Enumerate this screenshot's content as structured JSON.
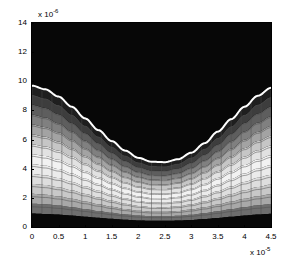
{
  "figure": {
    "title": "",
    "background_color": "#ffffff",
    "axis_color": "#000000",
    "plot_box": {
      "left": 31,
      "top": 22,
      "width": 241,
      "height": 206
    }
  },
  "xaxis": {
    "label": "",
    "exponent_label": "x 10",
    "exponent_value": "-5",
    "tick_labels": [
      "0",
      "0.5",
      "1",
      "1.5",
      "2",
      "2.5",
      "3",
      "3.5",
      "4",
      "4.5"
    ],
    "tick_values": [
      0,
      0.5,
      1,
      1.5,
      2,
      2.5,
      3,
      3.5,
      4,
      4.5
    ],
    "range": [
      0,
      4.5
    ]
  },
  "yaxis": {
    "label": "",
    "exponent_label": "x 10",
    "exponent_value": "-6",
    "tick_labels": [
      "0",
      "2",
      "4",
      "6",
      "8",
      "10",
      "12",
      "14"
    ],
    "tick_values": [
      0,
      2,
      4,
      6,
      8,
      10,
      12,
      14
    ],
    "range": [
      0,
      14
    ]
  },
  "chart_data": {
    "type": "heatmap",
    "title": "",
    "xlabel": "",
    "ylabel": "",
    "xlim": [
      0,
      4.5
    ],
    "ylim": [
      0,
      14
    ],
    "x_unit_exponent": -5,
    "y_unit_exponent": -6,
    "grid": true,
    "mesh_overlay": true,
    "colormap": "gray",
    "legend": "none",
    "white_curve": {
      "name": "interface",
      "color": "#ffffff",
      "line_width": 2,
      "x": [
        0.0,
        0.25,
        0.5,
        0.75,
        1.0,
        1.25,
        1.5,
        1.75,
        2.0,
        2.25,
        2.5,
        2.75,
        3.0,
        3.25,
        3.5,
        3.75,
        4.0,
        4.25,
        4.5
      ],
      "y": [
        9.7,
        9.45,
        8.95,
        8.25,
        7.45,
        6.65,
        5.9,
        5.25,
        4.75,
        4.48,
        4.45,
        4.65,
        5.1,
        5.75,
        6.55,
        7.4,
        8.25,
        9.0,
        9.55
      ]
    },
    "bands": [
      {
        "index": 0,
        "label": "band-0",
        "color": "#0a0a0a",
        "frac_lo": 0.0,
        "frac_hi": 0.095
      },
      {
        "index": 1,
        "label": "band-1",
        "color": "#6e6e6e",
        "frac_lo": 0.095,
        "frac_hi": 0.165
      },
      {
        "index": 2,
        "label": "band-2",
        "color": "#a8a8a8",
        "frac_lo": 0.165,
        "frac_hi": 0.235
      },
      {
        "index": 3,
        "label": "band-3",
        "color": "#c8c8c8",
        "frac_lo": 0.235,
        "frac_hi": 0.305
      },
      {
        "index": 4,
        "label": "band-4",
        "color": "#dedede",
        "frac_lo": 0.305,
        "frac_hi": 0.375
      },
      {
        "index": 5,
        "label": "band-5",
        "color": "#ebebeb",
        "frac_lo": 0.375,
        "frac_hi": 0.445
      },
      {
        "index": 6,
        "label": "band-6",
        "color": "#f2f2f2",
        "frac_lo": 0.445,
        "frac_hi": 0.515
      },
      {
        "index": 7,
        "label": "band-7",
        "color": "#e2e2e2",
        "frac_lo": 0.515,
        "frac_hi": 0.585
      },
      {
        "index": 8,
        "label": "band-8",
        "color": "#c6c6c6",
        "frac_lo": 0.585,
        "frac_hi": 0.655
      },
      {
        "index": 9,
        "label": "band-9",
        "color": "#a3a3a3",
        "frac_lo": 0.655,
        "frac_hi": 0.725
      },
      {
        "index": 10,
        "label": "band-10",
        "color": "#808080",
        "frac_lo": 0.725,
        "frac_hi": 0.795
      },
      {
        "index": 11,
        "label": "band-11",
        "color": "#5e5e5e",
        "frac_lo": 0.795,
        "frac_hi": 0.865
      },
      {
        "index": 12,
        "label": "band-12",
        "color": "#3d3d3d",
        "frac_lo": 0.865,
        "frac_hi": 0.935
      },
      {
        "index": 13,
        "label": "band-13",
        "color": "#1f1f1f",
        "frac_lo": 0.935,
        "frac_hi": 1.0
      }
    ],
    "upper_region_color": "#070707",
    "lower_region_bottom_color": "#080808",
    "mesh": {
      "columns": 24,
      "rows": 14,
      "line_color": "#4c4c4c",
      "line_width": 0.5
    },
    "surface_top_y": [
      14.0,
      13.7,
      13.1,
      12.35,
      11.5,
      10.65,
      9.85,
      9.2,
      8.72,
      8.45,
      8.45,
      8.7,
      9.2,
      9.9,
      10.75,
      11.65,
      12.5,
      13.25,
      13.8
    ]
  }
}
